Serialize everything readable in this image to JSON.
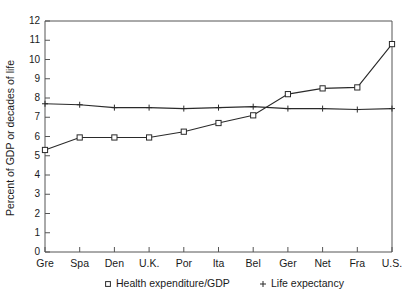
{
  "chart_data": {
    "type": "line",
    "title": "",
    "xlabel": "",
    "ylabel": "Percent of GDP or decades of life",
    "categories": [
      "Gre",
      "Spa",
      "Den",
      "U.K.",
      "Por",
      "Ita",
      "Bel",
      "Ger",
      "Net",
      "Fra",
      "U.S."
    ],
    "ylim": [
      0,
      12
    ],
    "yticks": [
      0,
      1,
      2,
      3,
      4,
      5,
      6,
      7,
      8,
      9,
      10,
      11,
      12
    ],
    "ytick_labels": [
      "0",
      "1",
      "2",
      "3",
      "4",
      "5",
      "6",
      "7",
      "8",
      "9",
      "10",
      "11",
      "12"
    ],
    "grid": false,
    "legend_position": "bottom",
    "series": [
      {
        "name": "Health expenditure/GDP",
        "marker": "square",
        "legend_symbol": "□",
        "values": [
          5.3,
          5.95,
          5.95,
          5.95,
          6.25,
          6.7,
          7.1,
          8.2,
          8.5,
          8.55,
          10.8
        ]
      },
      {
        "name": "Life expectancy",
        "marker": "plus",
        "legend_symbol": "+",
        "values": [
          7.7,
          7.65,
          7.5,
          7.5,
          7.45,
          7.5,
          7.55,
          7.45,
          7.45,
          7.4,
          7.45
        ]
      }
    ]
  },
  "legend": {
    "items": [
      {
        "symbol": "□",
        "label": "Health expenditure/GDP"
      },
      {
        "symbol": "+",
        "label": "Life expectancy"
      }
    ]
  }
}
